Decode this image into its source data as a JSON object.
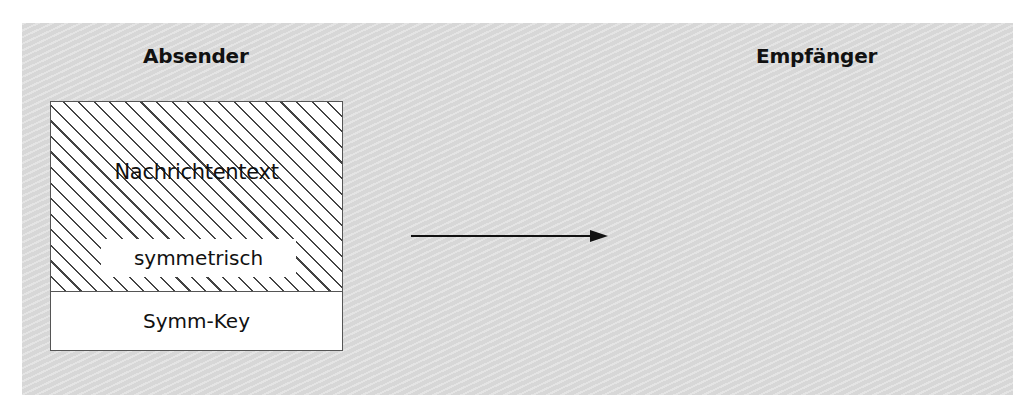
{
  "sender": {
    "title": "Absender",
    "message_box": {
      "body_label": "Nachrichtentext",
      "encryption_label": "symmetrisch",
      "key_label": "Symm-Key"
    }
  },
  "receiver": {
    "title": "Empfänger"
  },
  "arrow": {
    "direction": "right",
    "icon": "arrow-right-icon"
  },
  "colors": {
    "panel_background": "#dedede",
    "hatch": "#444444",
    "border": "#555555"
  }
}
